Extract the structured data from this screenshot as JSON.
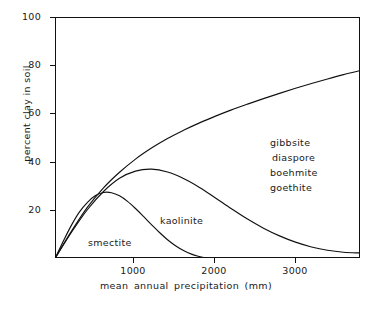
{
  "chart_data": {
    "type": "line",
    "title": "",
    "xlabel": "mean annual precipitation (mm)",
    "ylabel": "percent clay in soil",
    "xlim": [
      0,
      3800
    ],
    "ylim": [
      0,
      100
    ],
    "xticks": [
      1000,
      2000,
      3000
    ],
    "xtick_labels": [
      "1000",
      "2000",
      "3000"
    ],
    "yticks": [
      20,
      40,
      60,
      80,
      100
    ],
    "ytick_labels": [
      "20",
      "40",
      "60",
      "80",
      "100"
    ],
    "grid": false,
    "legend": "none",
    "series": [
      {
        "name": "smectite",
        "label": "smectite",
        "x": [
          0,
          100,
          200,
          300,
          400,
          500,
          600,
          700,
          800,
          900,
          1000,
          1100,
          1200,
          1300,
          1400,
          1500,
          1600,
          1700,
          1800,
          1850
        ],
        "values": [
          0,
          7,
          13.5,
          19,
          23,
          25.8,
          27.1,
          27.0,
          25.7,
          23.4,
          20.4,
          17.1,
          13.7,
          10.4,
          7.4,
          4.9,
          2.9,
          1.4,
          0.4,
          0
        ]
      },
      {
        "name": "kaolinite",
        "label": "kaolinite",
        "x": [
          0,
          200,
          400,
          600,
          800,
          1000,
          1200,
          1400,
          1600,
          1800,
          2000,
          2200,
          2400,
          2600,
          2800,
          3000,
          3200,
          3400,
          3600,
          3800
        ],
        "values": [
          0,
          10.5,
          20.0,
          27.5,
          33.0,
          36.0,
          36.8,
          35.6,
          32.9,
          29.2,
          24.8,
          20.3,
          16.0,
          12.2,
          9.0,
          6.4,
          4.4,
          3.0,
          2.2,
          1.9
        ]
      },
      {
        "name": "gibbsite-group",
        "label": "",
        "x": [
          0,
          200,
          400,
          600,
          800,
          1000,
          1200,
          1400,
          1600,
          1800,
          2000,
          2200,
          2400,
          2600,
          2800,
          3000,
          3200,
          3400,
          3600,
          3800
        ],
        "values": [
          0,
          11.0,
          21.0,
          29.0,
          35.5,
          41.0,
          45.6,
          49.6,
          53.0,
          56.1,
          58.9,
          61.5,
          63.9,
          66.2,
          68.4,
          70.5,
          72.5,
          74.4,
          76.2,
          77.8
        ]
      }
    ],
    "annotations": [
      {
        "name": "smectite",
        "text": "smectite",
        "x": 450,
        "y": 7
      },
      {
        "name": "kaolinite",
        "text": "kaolinite",
        "x": 1380,
        "y": 16
      },
      {
        "name": "gibbsite",
        "text": "gibbsite",
        "x": 2720,
        "y": 48
      },
      {
        "name": "diaspore",
        "text": "diaspore",
        "x": 2720,
        "y": 43
      },
      {
        "name": "boehmite",
        "text": "boehmite",
        "x": 2720,
        "y": 38
      },
      {
        "name": "goethite",
        "text": "goethite",
        "x": 2720,
        "y": 33
      }
    ]
  },
  "axes": {
    "y_label": "percent clay in soil",
    "x_label": "mean annual precipitation (mm)",
    "y_ticks": [
      {
        "value": "100",
        "top": 17
      },
      {
        "value": "80",
        "top": 65
      },
      {
        "value": "60",
        "top": 113
      },
      {
        "value": "40",
        "top": 162
      },
      {
        "value": "20",
        "top": 210
      }
    ],
    "x_ticks": [
      {
        "value": "1000",
        "left": 133
      },
      {
        "value": "2000",
        "left": 214
      },
      {
        "value": "3000",
        "left": 295
      }
    ]
  },
  "labels": {
    "smectite": "smectite",
    "kaolinite": "kaolinite",
    "gibbsite": "gibbsite",
    "diaspore": "diaspore",
    "boehmite": "boehmite",
    "goethite": "goethite"
  },
  "colors": {
    "line": "#111111",
    "background": "#ffffff",
    "text": "#1a1a1a"
  }
}
